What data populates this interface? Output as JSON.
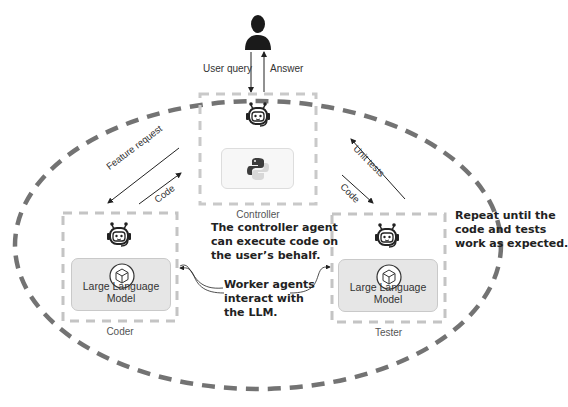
{
  "user": {
    "icon": "user-silhouette-icon",
    "query_label": "User query",
    "answer_label": "Answer"
  },
  "controller": {
    "caption": "Controller",
    "icons": [
      "robot-agent-icon",
      "python-icon"
    ]
  },
  "coder": {
    "caption": "Coder",
    "llm_label": "Large Language Model",
    "icons": [
      "robot-agent-icon",
      "cube-icon"
    ]
  },
  "tester": {
    "caption": "Tester",
    "llm_label": "Large Language Model",
    "icons": [
      "robot-agent-icon",
      "cube-icon"
    ]
  },
  "arrows": {
    "feature_request": "Feature request",
    "coder_code": "Code",
    "unit_tests": "Unit tests",
    "tester_code": "Code"
  },
  "annotations": {
    "controller_note": [
      "The controller agent",
      "can execute code on",
      "the user’s behalf."
    ],
    "worker_note": [
      "Worker agents",
      "interact with",
      "the LLM."
    ],
    "repeat_note": [
      "Repeat until the",
      "code and tests",
      "work as expected."
    ]
  },
  "colors": {
    "loop_ellipse": "#737373",
    "agent_box_border": "#c4c4c4",
    "llm_box_fill": "#e6e6e6",
    "text": "#333333"
  }
}
